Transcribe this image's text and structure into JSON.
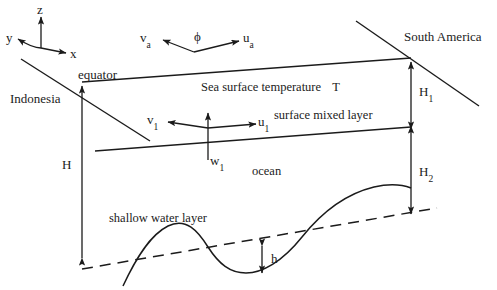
{
  "figure": {
    "background_color": "#ffffff",
    "line_color": "#1b1b1b"
  },
  "axes": {
    "z_label": "z",
    "y_label": "y",
    "x_label": "x"
  },
  "atmosphere": {
    "wind_v_label": "v",
    "wind_v_sub": "a",
    "wind_u_label": "u",
    "wind_u_sub": "a",
    "angle_label": "ϕ"
  },
  "boundaries": {
    "west_label": "Indonesia",
    "east_label": "South America",
    "equator_label": "equator"
  },
  "layers": {
    "sea_surface_label": "Sea surface temperature",
    "sea_surface_variable": "T",
    "mixed_layer_label": "surface mixed layer",
    "ocean_label": "ocean",
    "shallow_water_label": "shallow water layer"
  },
  "currents": {
    "v1_label": "v",
    "v1_sub": "1",
    "u1_label": "u",
    "u1_sub": "1",
    "w1_label": "w",
    "w1_sub": "1"
  },
  "depths": {
    "total_label": "H",
    "upper_label": "H",
    "upper_sub": "1",
    "lower_label": "H",
    "lower_sub": "2",
    "thermocline_label": "h"
  }
}
